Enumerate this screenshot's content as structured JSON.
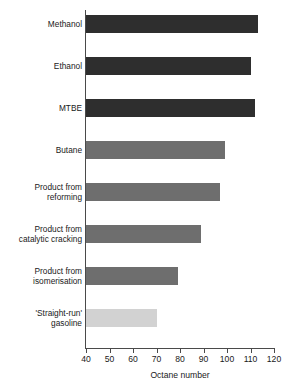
{
  "chart_data": {
    "type": "bar",
    "orientation": "horizontal",
    "title": "",
    "xlabel": "Octane number",
    "ylabel": "",
    "xlim": [
      40,
      120
    ],
    "xticks": [
      40,
      50,
      60,
      70,
      80,
      90,
      100,
      110,
      120
    ],
    "grid": false,
    "legend": "none",
    "categories": [
      "Methanol",
      "Ethanol",
      "MTBE",
      "Butane",
      "Product from reforming",
      "Product from catalytic cracking",
      "Product from isomerisation",
      "'Straight-run' gasoline"
    ],
    "values": [
      113,
      110,
      112,
      99,
      97,
      89,
      79,
      70
    ],
    "bars": [
      {
        "label_line1": "Methanol",
        "label_line2": "",
        "value": 113,
        "color_key": "dark"
      },
      {
        "label_line1": "Ethanol",
        "label_line2": "",
        "value": 110,
        "color_key": "dark"
      },
      {
        "label_line1": "MTBE",
        "label_line2": "",
        "value": 112,
        "color_key": "dark"
      },
      {
        "label_line1": "Butane",
        "label_line2": "",
        "value": 99,
        "color_key": "mid"
      },
      {
        "label_line1": "Product from",
        "label_line2": "reforming",
        "value": 97,
        "color_key": "mid"
      },
      {
        "label_line1": "Product from",
        "label_line2": "catalytic cracking",
        "value": 89,
        "color_key": "mid"
      },
      {
        "label_line1": "Product from",
        "label_line2": "isomerisation",
        "value": 79,
        "color_key": "mid"
      },
      {
        "label_line1": "'Straight-run'",
        "label_line2": "gasoline",
        "value": 70,
        "color_key": "light"
      }
    ],
    "colors": {
      "dark": "#2e2e2e",
      "mid": "#6e6e6e",
      "light": "#d2d2d2",
      "axis": "#4a4a4a",
      "background": "#ffffff"
    }
  }
}
